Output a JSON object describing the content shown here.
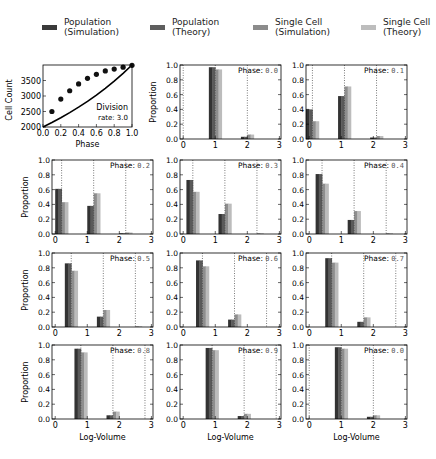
{
  "legend": [
    {
      "label": "Population\n(Simulation)",
      "color": "#3a3a3a",
      "x": 42
    },
    {
      "label": "Population\n(Theory)",
      "color": "#5e5e5e",
      "x": 150
    },
    {
      "label": "Single Cell\n(Simulation)",
      "color": "#8c8c8c",
      "x": 253
    },
    {
      "label": "Single Cell\n(Theory)",
      "color": "#bdbdbd",
      "x": 361
    }
  ],
  "chart_data": [
    {
      "type": "line",
      "title": "",
      "xlabel": "Phase",
      "ylabel": "Cell Count",
      "xlim": [
        0.0,
        1.0
      ],
      "ylim": [
        2000,
        4000
      ],
      "xticks": [
        "0.0",
        "0.2",
        "0.4",
        "0.6",
        "0.8",
        "1.0"
      ],
      "yticks": [
        "2000",
        "2500",
        "3000",
        "3500"
      ],
      "annotation": "Division\nrate: 3.0",
      "series": [
        {
          "name": "Theory",
          "style": "line",
          "x": [
            0.0,
            0.1,
            0.2,
            0.3,
            0.4,
            0.5,
            0.6,
            0.7,
            0.8,
            0.9,
            1.0
          ],
          "values": [
            2000,
            2143,
            2297,
            2462,
            2639,
            2828,
            3031,
            3249,
            3482,
            3732,
            4000
          ]
        },
        {
          "name": "Simulation",
          "style": "markers",
          "x": [
            0.1,
            0.2,
            0.3,
            0.4,
            0.5,
            0.6,
            0.7,
            0.8,
            0.9,
            1.0
          ],
          "values": [
            2500,
            2900,
            3170,
            3390,
            3570,
            3700,
            3810,
            3870,
            3930,
            3990
          ]
        }
      ]
    },
    {
      "type": "bar",
      "xlabel": "Log-Volume",
      "ylabel": "Proportion",
      "xlim": [
        -0.1,
        3.05
      ],
      "ylim": [
        0,
        1.0
      ],
      "xticks": [
        "0",
        "1",
        "2",
        "3"
      ],
      "yticks": [
        "0.0",
        "0.2",
        "0.4",
        "0.6",
        "0.8",
        "1.0"
      ],
      "series_names": [
        "Population (Simulation)",
        "Population (Theory)",
        "Single Cell (Simulation)",
        "Single Cell (Theory)"
      ],
      "panels": [
        {
          "phase_label": "Phase:",
          "phase_value": "0.0",
          "dashed": [
            0.0,
            1.0,
            2.0
          ],
          "groups": [
            {
              "x": 0.0,
              "values": [
                0,
                0,
                0,
                0
              ]
            },
            {
              "x": 1.0,
              "values": [
                0.97,
                0.97,
                0.94,
                0.94
              ]
            },
            {
              "x": 2.0,
              "values": [
                0.03,
                0.03,
                0.06,
                0.06
              ]
            }
          ]
        },
        {
          "phase_label": "Phase:",
          "phase_value": "0.1",
          "dashed": [
            0.1,
            1.1,
            2.1
          ],
          "groups": [
            {
              "x": 0.1,
              "values": [
                0.4,
                0.4,
                0.24,
                0.24
              ]
            },
            {
              "x": 1.1,
              "values": [
                0.58,
                0.58,
                0.71,
                0.71
              ]
            },
            {
              "x": 2.1,
              "values": [
                0.02,
                0.02,
                0.04,
                0.04
              ]
            }
          ]
        },
        {
          "phase_label": "Phase:",
          "phase_value": "0.2",
          "dashed": [
            0.2,
            1.2,
            2.2
          ],
          "groups": [
            {
              "x": 0.2,
              "values": [
                0.61,
                0.61,
                0.43,
                0.43
              ]
            },
            {
              "x": 1.2,
              "values": [
                0.38,
                0.38,
                0.55,
                0.55
              ]
            },
            {
              "x": 2.2,
              "values": [
                0.01,
                0.01,
                0.02,
                0.02
              ]
            }
          ]
        },
        {
          "phase_label": "Phase:",
          "phase_value": "0.3",
          "dashed": [
            0.3,
            1.3,
            2.3
          ],
          "groups": [
            {
              "x": 0.3,
              "values": [
                0.73,
                0.73,
                0.57,
                0.57
              ]
            },
            {
              "x": 1.3,
              "values": [
                0.27,
                0.27,
                0.41,
                0.41
              ]
            },
            {
              "x": 2.3,
              "values": [
                0.0,
                0.0,
                0.01,
                0.01
              ]
            }
          ]
        },
        {
          "phase_label": "Phase:",
          "phase_value": "0.4",
          "dashed": [
            0.4,
            1.4,
            2.4
          ],
          "groups": [
            {
              "x": 0.4,
              "values": [
                0.81,
                0.81,
                0.68,
                0.68
              ]
            },
            {
              "x": 1.4,
              "values": [
                0.19,
                0.19,
                0.31,
                0.31
              ]
            },
            {
              "x": 2.4,
              "values": [
                0.0,
                0.0,
                0.01,
                0.01
              ]
            }
          ]
        },
        {
          "phase_label": "Phase:",
          "phase_value": "0.5",
          "dashed": [
            0.5,
            1.5,
            2.5
          ],
          "groups": [
            {
              "x": 0.5,
              "values": [
                0.86,
                0.86,
                0.76,
                0.76
              ]
            },
            {
              "x": 1.5,
              "values": [
                0.14,
                0.14,
                0.23,
                0.23
              ]
            },
            {
              "x": 2.5,
              "values": [
                0.0,
                0.0,
                0.01,
                0.01
              ]
            }
          ]
        },
        {
          "phase_label": "Phase:",
          "phase_value": "0.6",
          "dashed": [
            0.6,
            1.6,
            2.6
          ],
          "groups": [
            {
              "x": 0.6,
              "values": [
                0.9,
                0.9,
                0.82,
                0.82
              ]
            },
            {
              "x": 1.6,
              "values": [
                0.1,
                0.1,
                0.17,
                0.17
              ]
            },
            {
              "x": 2.6,
              "values": [
                0.0,
                0.0,
                0.0,
                0.0
              ]
            }
          ]
        },
        {
          "phase_label": "Phase:",
          "phase_value": "0.7",
          "dashed": [
            0.7,
            1.7,
            2.7
          ],
          "groups": [
            {
              "x": 0.7,
              "values": [
                0.93,
                0.93,
                0.87,
                0.87
              ]
            },
            {
              "x": 1.7,
              "values": [
                0.07,
                0.07,
                0.13,
                0.13
              ]
            },
            {
              "x": 2.7,
              "values": [
                0.0,
                0.0,
                0.0,
                0.0
              ]
            }
          ]
        },
        {
          "phase_label": "Phase:",
          "phase_value": "0.8",
          "dashed": [
            0.8,
            1.8,
            2.8
          ],
          "groups": [
            {
              "x": 0.8,
              "values": [
                0.95,
                0.95,
                0.9,
                0.9
              ]
            },
            {
              "x": 1.8,
              "values": [
                0.05,
                0.05,
                0.1,
                0.1
              ]
            },
            {
              "x": 2.8,
              "values": [
                0.0,
                0.0,
                0.0,
                0.0
              ]
            }
          ]
        },
        {
          "phase_label": "Phase:",
          "phase_value": "0.9",
          "dashed": [
            0.9,
            1.9,
            2.9
          ],
          "groups": [
            {
              "x": 0.9,
              "values": [
                0.96,
                0.96,
                0.93,
                0.93
              ]
            },
            {
              "x": 1.9,
              "values": [
                0.04,
                0.04,
                0.07,
                0.07
              ]
            },
            {
              "x": 2.9,
              "values": [
                0.0,
                0.0,
                0.0,
                0.0
              ]
            }
          ]
        },
        {
          "phase_label": "Phase:",
          "phase_value": "0.0",
          "dashed": [
            0.0,
            1.0,
            2.0
          ],
          "groups": [
            {
              "x": 1.0,
              "values": [
                0.97,
                0.97,
                0.95,
                0.95
              ]
            },
            {
              "x": 2.0,
              "values": [
                0.03,
                0.03,
                0.05,
                0.05
              ]
            }
          ]
        }
      ]
    }
  ],
  "layout": {
    "line_panel": {
      "left": 43,
      "top": 65,
      "width": 89,
      "height": 62
    },
    "bar_panels": [
      {
        "left": 180,
        "top": 65
      },
      {
        "left": 306,
        "top": 65
      },
      {
        "left": 52,
        "top": 160
      },
      {
        "left": 180,
        "top": 160
      },
      {
        "left": 306,
        "top": 160
      },
      {
        "left": 52,
        "top": 253
      },
      {
        "left": 180,
        "top": 253
      },
      {
        "left": 306,
        "top": 253
      },
      {
        "left": 52,
        "top": 345
      },
      {
        "left": 180,
        "top": 345
      },
      {
        "left": 306,
        "top": 345
      }
    ],
    "bar_panel_size": {
      "width": 101,
      "height": 74
    },
    "bar_colors": [
      "#333333",
      "#5a5a5a",
      "#8e8e8e",
      "#bcbcbc"
    ]
  }
}
